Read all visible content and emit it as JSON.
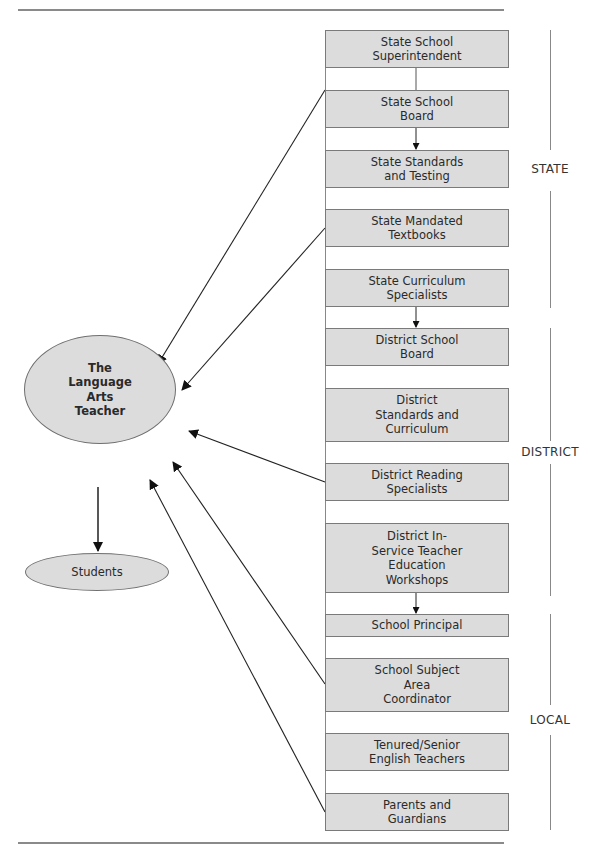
{
  "diagram": {
    "center_node": {
      "label": "The\nLanguage\nArts\nTeacher"
    },
    "output_node": {
      "label": "Students"
    },
    "levels": [
      {
        "label": "STATE"
      },
      {
        "label": "DISTRICT"
      },
      {
        "label": "LOCAL"
      }
    ],
    "boxes": [
      {
        "label": "State School\nSuperintendent",
        "level": "STATE"
      },
      {
        "label": "State School\nBoard",
        "level": "STATE"
      },
      {
        "label": "State Standards\nand Testing",
        "level": "STATE"
      },
      {
        "label": "State Mandated\nTextbooks",
        "level": "STATE"
      },
      {
        "label": "State Curriculum\nSpecialists",
        "level": "STATE"
      },
      {
        "label": "District School\nBoard",
        "level": "DISTRICT"
      },
      {
        "label": "District\nStandards and\nCurriculum",
        "level": "DISTRICT"
      },
      {
        "label": "District Reading\nSpecialists",
        "level": "DISTRICT"
      },
      {
        "label": "District In-\nService Teacher\nEducation\nWorkshops",
        "level": "DISTRICT"
      },
      {
        "label": "School Principal",
        "level": "LOCAL"
      },
      {
        "label": "School Subject\nArea\nCoordinator",
        "level": "LOCAL"
      },
      {
        "label": "Tenured/Senior\nEnglish Teachers",
        "level": "LOCAL"
      },
      {
        "label": "Parents and\nGuardians",
        "level": "LOCAL"
      }
    ],
    "edges": [
      {
        "from": "State School Superintendent",
        "to": "State School Board",
        "type": "line"
      },
      {
        "from": "State School Board",
        "to": "State Standards and Testing",
        "type": "arrow"
      },
      {
        "from": "State Curriculum Specialists",
        "to": "District School Board",
        "type": "arrow"
      },
      {
        "from": "District In-Service Teacher Education Workshops",
        "to": "School Principal",
        "type": "arrow"
      },
      {
        "from": "State School Board",
        "to": "The Language Arts Teacher",
        "type": "arrow"
      },
      {
        "from": "State Mandated Textbooks",
        "to": "The Language Arts Teacher",
        "type": "arrow"
      },
      {
        "from": "District Reading Specialists",
        "to": "The Language Arts Teacher",
        "type": "arrow"
      },
      {
        "from": "School Subject Area Coordinator",
        "to": "The Language Arts Teacher",
        "type": "arrow"
      },
      {
        "from": "Parents and Guardians",
        "to": "The Language Arts Teacher",
        "type": "arrow"
      },
      {
        "from": "The Language Arts Teacher",
        "to": "Students",
        "type": "arrow"
      }
    ],
    "colors": {
      "box_fill": "#dcdcdc",
      "box_border": "#7a7a7a",
      "line": "#222222",
      "rule": "#8a8a8a"
    }
  }
}
